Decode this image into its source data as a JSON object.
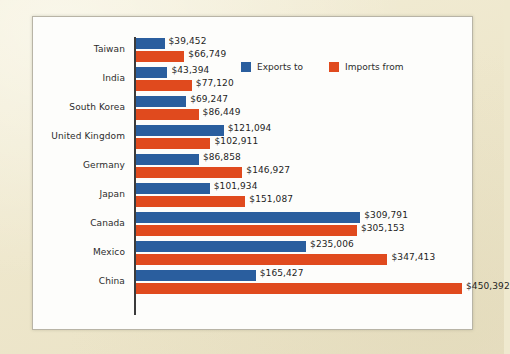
{
  "chart_data": {
    "type": "bar",
    "orientation": "horizontal",
    "title": "",
    "xlabel": "",
    "ylabel": "",
    "grid": false,
    "legend_position": "top-right",
    "xlim": [
      0,
      460000
    ],
    "value_prefix": "$",
    "categories": [
      "Taiwan",
      "India",
      "South Korea",
      "United Kingdom",
      "Germany",
      "Japan",
      "Canada",
      "Mexico",
      "China"
    ],
    "series": [
      {
        "name": "Exports to",
        "color": "#2a5e9e",
        "values": [
          39452,
          43394,
          69247,
          121094,
          86858,
          101934,
          309791,
          235006,
          165427
        ],
        "labels": [
          "$39,452",
          "$43,394",
          "$69,247",
          "$121,094",
          "$86,858",
          "$101,934",
          "$309,791",
          "$235,006",
          "$165,427"
        ]
      },
      {
        "name": "Imports from",
        "color": "#e04a1e",
        "values": [
          66749,
          77120,
          86449,
          102911,
          146927,
          151087,
          305153,
          347413,
          450392
        ],
        "labels": [
          "$66,749",
          "$77,120",
          "$86,449",
          "$102,911",
          "$146,927",
          "$151,087",
          "$305,153",
          "$347,413",
          "$450,392"
        ]
      }
    ]
  },
  "legend": {
    "items": [
      {
        "label": "Exports to",
        "color": "#2a5e9e"
      },
      {
        "label": "Imports from",
        "color": "#e04a1e"
      }
    ]
  },
  "colors": {
    "page_background": "#efe9cf",
    "panel_background": "#fdfdfb",
    "panel_border": "#b8b4a6",
    "axis": "#3b3b3b",
    "exports": "#2a5e9e",
    "imports": "#e04a1e",
    "text": "#2c2c2c"
  }
}
